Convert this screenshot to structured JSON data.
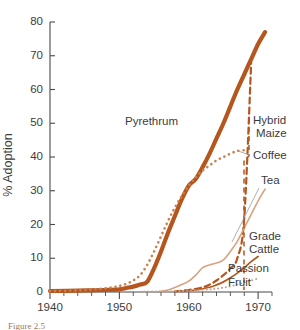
{
  "figure": {
    "name": "adoption-curves-figure",
    "caption_fragment": "Figure 2.5",
    "background_color": "#ffffff"
  },
  "axes": {
    "x_label": "",
    "y_label": "% Adoption",
    "x_ticks": [
      "1940",
      "1950",
      "1960",
      "1970"
    ],
    "x_tick_values": [
      1940,
      1950,
      1960,
      1970
    ],
    "y_ticks": [
      "0",
      "10",
      "20",
      "30",
      "40",
      "50",
      "60",
      "70",
      "80"
    ],
    "y_tick_values": [
      0,
      10,
      20,
      30,
      40,
      50,
      60,
      70,
      80
    ],
    "x_minor_step": 2,
    "y_minor_step": 10,
    "axis_color": "#4a4a4a",
    "grid": false
  },
  "labels": {
    "pyrethrum": "Pyrethrum",
    "hybrid_maize_line1": "Hybrid",
    "hybrid_maize_line2": "Maize",
    "coffee": "Coffee",
    "tea": "Tea",
    "grade_cattle_line1": "Grade",
    "grade_cattle_line2": "Cattle",
    "passion_fruit_line1": "Passion",
    "passion_fruit_line2": "Fruit"
  },
  "chart_data": {
    "type": "line",
    "title": "",
    "xlabel": "",
    "ylabel": "% Adoption",
    "xlim": [
      1940,
      1972
    ],
    "ylim": [
      0,
      80
    ],
    "grid": false,
    "legend_position": "inline-annotations",
    "series": [
      {
        "name": "Pyrethrum",
        "color": "#b4561e",
        "style": "solid-thick",
        "stroke_width": 4.2,
        "x": [
          1940,
          1944,
          1948,
          1950,
          1951,
          1952,
          1953,
          1954,
          1955,
          1956,
          1957,
          1958,
          1959,
          1960,
          1961,
          1962,
          1963,
          1964,
          1965,
          1966,
          1967,
          1968,
          1969,
          1970,
          1971
        ],
        "y": [
          0.3,
          0.4,
          0.6,
          0.8,
          1.2,
          1.6,
          2.2,
          3.0,
          7.0,
          12.0,
          17.5,
          22.5,
          27.5,
          31.5,
          33.5,
          37.0,
          41.0,
          45.5,
          50.0,
          55.0,
          60.0,
          64.5,
          69.0,
          73.5,
          77.0
        ]
      },
      {
        "name": "Coffee",
        "color": "#c9804f",
        "style": "dotted",
        "stroke_width": 2.6,
        "x": [
          1940,
          1944,
          1947,
          1949,
          1950,
          1951,
          1952,
          1953,
          1954,
          1955,
          1956,
          1957,
          1958,
          1959,
          1960,
          1961,
          1962,
          1963,
          1964,
          1965,
          1966,
          1967,
          1968
        ],
        "y": [
          0.3,
          0.5,
          0.9,
          1.4,
          1.8,
          2.4,
          3.4,
          5.0,
          8.0,
          12.0,
          16.5,
          21.0,
          25.0,
          28.5,
          31.5,
          34.0,
          36.0,
          37.5,
          39.0,
          40.0,
          41.0,
          41.8,
          42.0
        ]
      },
      {
        "name": "Hybrid Maize",
        "color": "#b4561e",
        "style": "dashed",
        "stroke_width": 2.2,
        "x": [
          1958,
          1960,
          1962,
          1963,
          1964,
          1965,
          1966,
          1967,
          1968,
          1969
        ],
        "y": [
          0.2,
          0.6,
          1.4,
          2.2,
          3.4,
          5.0,
          7.0,
          10.0,
          22.0,
          68.0
        ]
      },
      {
        "name": "Tea",
        "color": "#d9a27e",
        "style": "solid-thin",
        "stroke_width": 1.6,
        "x": [
          1956,
          1957,
          1958,
          1959,
          1960,
          1961,
          1962,
          1963,
          1964,
          1965,
          1966,
          1967,
          1968,
          1969,
          1970,
          1971
        ],
        "y": [
          0.2,
          0.6,
          1.3,
          2.2,
          3.2,
          5.0,
          7.2,
          8.0,
          8.6,
          9.5,
          12.0,
          15.0,
          19.0,
          23.0,
          27.0,
          30.5
        ]
      },
      {
        "name": "Grade Cattle",
        "color": "#b4561e",
        "style": "solid-thin",
        "stroke_width": 1.7,
        "x": [
          1959,
          1961,
          1963,
          1964,
          1965,
          1966,
          1967,
          1968,
          1969,
          1970
        ],
        "y": [
          0.2,
          0.6,
          1.4,
          2.1,
          3.0,
          4.2,
          5.6,
          7.2,
          9.0,
          10.5
        ]
      },
      {
        "name": "Passion Fruit",
        "color": "#c9a08a",
        "style": "dotted",
        "stroke_width": 2.0,
        "x": [
          1953,
          1956,
          1959,
          1961,
          1963,
          1964,
          1965,
          1966,
          1967,
          1968,
          1969,
          1970
        ],
        "y": [
          0.1,
          0.2,
          0.3,
          0.5,
          0.8,
          1.0,
          1.3,
          1.7,
          2.2,
          2.8,
          3.4,
          4.0
        ]
      }
    ]
  }
}
